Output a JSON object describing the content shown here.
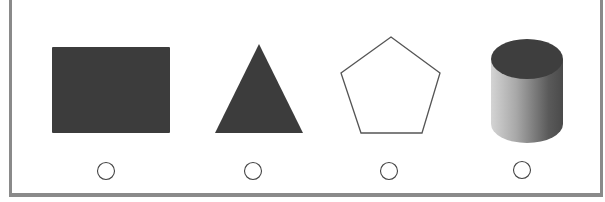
{
  "question": {
    "options": [
      {
        "id": "A",
        "shape": "rectangle",
        "fill": "#3c3c3c",
        "selected": false
      },
      {
        "id": "B",
        "shape": "triangle",
        "fill": "#3c3c3c",
        "selected": false
      },
      {
        "id": "C",
        "shape": "pentagon",
        "fill": "#ffffff",
        "stroke": "#555555",
        "selected": false
      },
      {
        "id": "D",
        "shape": "cylinder",
        "fill": "#6e6e6e",
        "selected": false
      }
    ]
  },
  "colors": {
    "border": "#8a8a8a",
    "dark_fill": "#3c3c3c",
    "radio_stroke": "#444444"
  }
}
